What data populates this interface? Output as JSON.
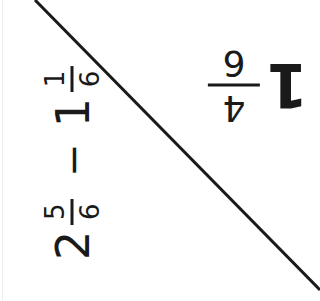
{
  "card": {
    "problem": {
      "a_whole": "2",
      "a_num": "5",
      "a_den": "6",
      "operator": "−",
      "b_whole": "1",
      "b_num": "1",
      "b_den": "6"
    },
    "answer": {
      "whole": "1",
      "num": "4",
      "den": "6"
    },
    "divider": {
      "from": [
        35,
        0
      ],
      "to": [
        320,
        290
      ],
      "color": "#1a1a1a"
    }
  }
}
